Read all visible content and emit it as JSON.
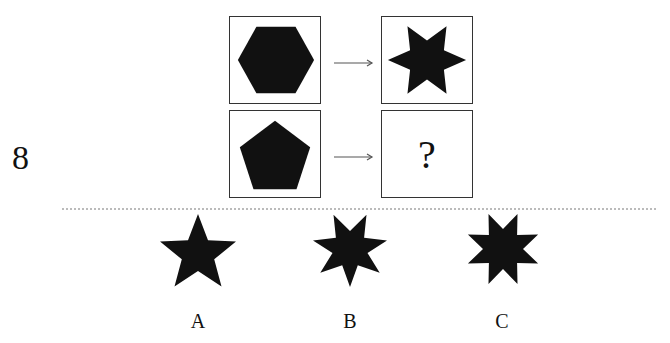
{
  "question": {
    "number": "8",
    "grid": [
      {
        "left_shape": "hexagon-icon",
        "right_shape": "six-point-star-icon"
      },
      {
        "left_shape": "pentagon-icon",
        "right_text": "?"
      }
    ],
    "arrow": "right-arrow-icon"
  },
  "options": [
    {
      "label": "A",
      "shape": "five-point-star-icon",
      "points": 5
    },
    {
      "label": "B",
      "shape": "seven-point-star-icon",
      "points": 7
    },
    {
      "label": "C",
      "shape": "eight-point-star-icon",
      "points": 8
    }
  ],
  "colors": {
    "shape_fill": "#111111",
    "border": "#333333",
    "divider": "#bbbbbb"
  }
}
